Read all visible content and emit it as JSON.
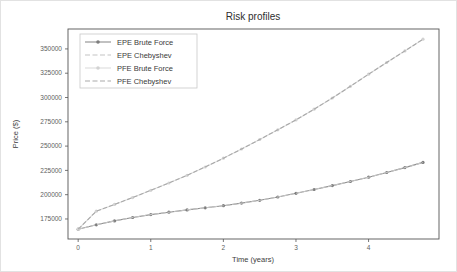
{
  "colors": {
    "background": "#ffffff",
    "frame": "#555555",
    "tick_color": "#555555",
    "title_text": "#2e2e2e",
    "legend_border": "#c9c9c9"
  },
  "chart_data": {
    "type": "line",
    "title": "Risk profiles",
    "xlabel": "Time (years)",
    "ylabel": "Price ($)",
    "grid": false,
    "legend_position": "upper left",
    "xlim": [
      -0.14,
      4.97
    ],
    "ylim": [
      154400,
      370500
    ],
    "xticks": [
      0,
      1,
      2,
      3,
      4
    ],
    "yticks": [
      175000,
      200000,
      225000,
      250000,
      275000,
      300000,
      325000,
      350000
    ],
    "x": [
      0,
      0.25,
      0.5,
      0.75,
      1,
      1.25,
      1.5,
      1.75,
      2,
      2.25,
      2.5,
      2.75,
      3,
      3.25,
      3.5,
      3.75,
      4,
      4.25,
      4.5,
      4.75
    ],
    "series": [
      {
        "name": "EPE Brute Force",
        "style": "solid",
        "marker": "circle",
        "color": "#8f8f8f",
        "marker_color": "#7d7d7d",
        "values": [
          164500,
          169000,
          173000,
          176500,
          179500,
          182000,
          184300,
          186500,
          188700,
          191300,
          194200,
          197600,
          201400,
          205300,
          209400,
          213600,
          218000,
          222800,
          227900,
          233200
        ]
      },
      {
        "name": "EPE Chebyshev",
        "style": "dashed",
        "marker": "none",
        "color": "#c4c4c4",
        "marker_color": "#c4c4c4",
        "values": [
          164500,
          169000,
          173000,
          176500,
          179500,
          182000,
          184300,
          186500,
          188700,
          191300,
          194200,
          197600,
          201400,
          205300,
          209400,
          213600,
          218000,
          222800,
          227900,
          233200
        ]
      },
      {
        "name": "PFE Brute Force",
        "style": "solid",
        "marker": "circle",
        "color": "#dcdcdc",
        "marker_color": "#d2d2d2",
        "values": [
          164500,
          183000,
          190000,
          197000,
          204500,
          212000,
          220000,
          228500,
          237500,
          247000,
          256800,
          266800,
          277000,
          288000,
          299500,
          311500,
          324000,
          336000,
          348000,
          360000
        ]
      },
      {
        "name": "PFE Chebyshev",
        "style": "dashed",
        "marker": "none",
        "color": "#a9a9a9",
        "marker_color": "#a9a9a9",
        "values": [
          164500,
          183000,
          190000,
          197000,
          204500,
          212000,
          220000,
          228500,
          237500,
          247000,
          256800,
          266800,
          277000,
          288000,
          299500,
          311500,
          324000,
          336000,
          348000,
          360000
        ]
      }
    ]
  }
}
